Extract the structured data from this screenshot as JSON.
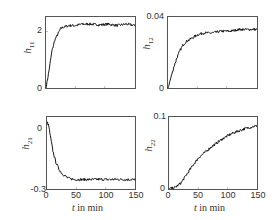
{
  "chart_data": [
    {
      "type": "line",
      "id": "h11",
      "ylabel": "h",
      "ylabel_sub": "11",
      "xlabel": "",
      "xlim": [
        0,
        150
      ],
      "ylim": [
        0,
        2.5
      ],
      "yticks": [
        "0",
        "2"
      ],
      "ytick_values": [
        0,
        2
      ],
      "xticks": [],
      "x": [
        0,
        5,
        10,
        15,
        20,
        25,
        30,
        40,
        50,
        60,
        75,
        90,
        105,
        120,
        135,
        150
      ],
      "values": [
        0,
        0.6,
        1.3,
        1.7,
        1.9,
        2.1,
        2.15,
        2.2,
        2.2,
        2.25,
        2.25,
        2.22,
        2.25,
        2.2,
        2.25,
        2.2
      ],
      "grid": false
    },
    {
      "type": "line",
      "id": "h12",
      "ylabel": "h",
      "ylabel_sub": "12",
      "xlabel": "",
      "xlim": [
        0,
        150
      ],
      "ylim": [
        0,
        0.04
      ],
      "yticks": [
        "0",
        "0.04"
      ],
      "ytick_values": [
        0,
        0.04
      ],
      "xticks": [],
      "x": [
        0,
        5,
        10,
        15,
        20,
        25,
        30,
        40,
        50,
        60,
        75,
        90,
        105,
        120,
        135,
        150
      ],
      "values": [
        0,
        0.006,
        0.012,
        0.017,
        0.021,
        0.024,
        0.026,
        0.028,
        0.03,
        0.031,
        0.031,
        0.032,
        0.032,
        0.033,
        0.033,
        0.033
      ],
      "grid": false
    },
    {
      "type": "line",
      "id": "h21",
      "ylabel": "h",
      "ylabel_sub": "21",
      "xlabel": "t in min",
      "xlim": [
        0,
        150
      ],
      "ylim": [
        -0.3,
        0.02
      ],
      "yticks": [
        "0",
        "-0.3"
      ],
      "ytick_values": [
        0,
        -0.3
      ],
      "xticks": [
        "0",
        "50",
        "100",
        "150"
      ],
      "xtick_values": [
        0,
        50,
        100,
        150
      ],
      "x": [
        0,
        3,
        6,
        10,
        15,
        20,
        25,
        30,
        35,
        40,
        50,
        60,
        75,
        90,
        105,
        120,
        135,
        150
      ],
      "values": [
        0,
        -0.02,
        -0.07,
        -0.13,
        -0.18,
        -0.21,
        -0.23,
        -0.24,
        -0.25,
        -0.255,
        -0.258,
        -0.258,
        -0.258,
        -0.257,
        -0.258,
        -0.257,
        -0.258,
        -0.258
      ],
      "grid": false
    },
    {
      "type": "line",
      "id": "h22",
      "ylabel": "h",
      "ylabel_sub": "22",
      "xlabel": "t in min",
      "xlim": [
        0,
        150
      ],
      "ylim": [
        0,
        0.1
      ],
      "yticks": [
        "0",
        "0.1"
      ],
      "ytick_values": [
        0,
        0.1
      ],
      "xticks": [
        "0",
        "50",
        "100",
        "150"
      ],
      "xtick_values": [
        0,
        50,
        100,
        150
      ],
      "x": [
        0,
        10,
        20,
        30,
        40,
        50,
        60,
        70,
        80,
        90,
        100,
        110,
        120,
        130,
        140,
        150
      ],
      "values": [
        0,
        0.002,
        0.008,
        0.02,
        0.032,
        0.043,
        0.05,
        0.057,
        0.063,
        0.069,
        0.074,
        0.078,
        0.081,
        0.084,
        0.086,
        0.088
      ],
      "grid": false
    }
  ],
  "panels": [
    {
      "ylabel": "h",
      "sub": "11",
      "yticks": [
        "2",
        "0"
      ],
      "xticks": []
    },
    {
      "ylabel": "h",
      "sub": "12",
      "yticks": [
        "0.04",
        "0"
      ],
      "xticks": []
    },
    {
      "ylabel": "h",
      "sub": "21",
      "yticks": [
        "0",
        "-0.3"
      ],
      "xticks": [
        "0",
        "50",
        "100",
        "150"
      ],
      "xlabel_t": "t",
      "xlabel_rest": " in min"
    },
    {
      "ylabel": "h",
      "sub": "22",
      "yticks": [
        "0.1",
        "0"
      ],
      "xticks": [
        "0",
        "50",
        "100",
        "150"
      ],
      "xlabel_t": "t",
      "xlabel_rest": " in min"
    }
  ]
}
